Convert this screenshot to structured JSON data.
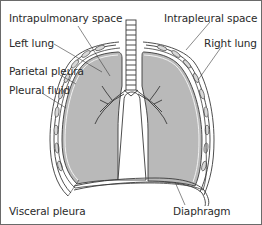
{
  "diagram": {
    "labels": {
      "intrapulmonary_space": "Intrapulmonary space",
      "left_lung": "Left lung",
      "parietal_pleura": "Parietal pleura",
      "pleural_fluid": "Pleural fluid",
      "intrapleural_space": "Intrapleural space",
      "right_lung": "Right lung",
      "visceral_pleura": "Visceral pleura",
      "diaphragm": "Diaphragm"
    },
    "colors": {
      "lung_fill": "#b9b9b9",
      "outline": "#3a3a3a",
      "label_text": "#2a2a2a",
      "frame": "#6a6a6a",
      "background": "#ffffff"
    }
  }
}
